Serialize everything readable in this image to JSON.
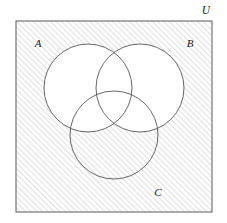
{
  "diagram": {
    "type": "venn-3-set",
    "title": "",
    "shaded_region_expression": "complement of (A union B)",
    "labels": {
      "universe": "U",
      "set_a": "A",
      "set_b": "B",
      "set_c": "C"
    },
    "colors": {
      "stroke": "#4a4a4a",
      "box_stroke": "#5a5a5a",
      "hatch": "#b8b8b8",
      "fill_unshaded": "#ffffff",
      "background": "#ffffff",
      "label_text": "#1a1a1a"
    },
    "geometry": {
      "box": {
        "x": 16,
        "y": 21,
        "width": 196,
        "height": 191
      },
      "circles": [
        {
          "name": "A",
          "cx": 88,
          "cy": 88,
          "r": 44,
          "shaded": false
        },
        {
          "name": "B",
          "cx": 140,
          "cy": 88,
          "r": 44,
          "shaded": false
        },
        {
          "name": "C",
          "cx": 114,
          "cy": 135,
          "r": 44,
          "shaded": "partial"
        }
      ],
      "hatch": {
        "angle_degrees": 45,
        "spacing": 4,
        "line_width": 0.8
      }
    },
    "label_positions": {
      "universe": {
        "x": 206,
        "y": 14
      },
      "set_a": {
        "x": 38,
        "y": 47
      },
      "set_b": {
        "x": 190,
        "y": 47
      },
      "set_c": {
        "x": 158,
        "y": 196
      }
    },
    "regions": [
      {
        "id": "outside-all",
        "expression": "U minus (A union B union C)",
        "shaded": true
      },
      {
        "id": "a-only",
        "expression": "A only",
        "shaded": false
      },
      {
        "id": "b-only",
        "expression": "B only",
        "shaded": false
      },
      {
        "id": "c-only",
        "expression": "C only",
        "shaded": true
      },
      {
        "id": "a-and-b",
        "expression": "A intersect B",
        "shaded": false
      },
      {
        "id": "a-and-c",
        "expression": "A intersect C",
        "shaded": false
      },
      {
        "id": "b-and-c",
        "expression": "B intersect C",
        "shaded": false
      },
      {
        "id": "a-and-b-and-c",
        "expression": "A intersect B intersect C",
        "shaded": false
      }
    ]
  }
}
